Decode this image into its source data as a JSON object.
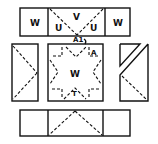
{
  "diagram": {
    "type": "folding-net",
    "labels": {
      "top_left": "W",
      "top_center": "V",
      "top_center_left": "U",
      "top_center_right": "U",
      "top_right": "W",
      "junction": "A1",
      "center": "W",
      "center_corner": "A",
      "center_bottom": "T"
    },
    "colors": {
      "line": "#111111",
      "background": "#ffffff"
    }
  }
}
